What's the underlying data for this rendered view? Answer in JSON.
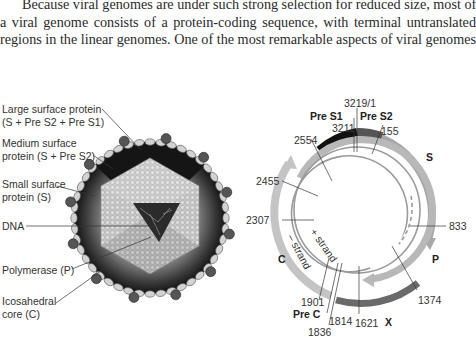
{
  "body_text": {
    "lines": [
      "Because viral genomes are under such strong selection for reduced size, most of",
      "a viral genome consists of a protein-coding sequence, with terminal untranslated",
      "regions in the linear genomes. One of the most remarkable aspects of viral genomes"
    ]
  },
  "virion_figure": {
    "labels": {
      "large_surface_protein": [
        "Large surface protein",
        "(S + Pre S2 + Pre S1)"
      ],
      "medium_surface_protein": [
        "Medium surface",
        "protein (S + Pre S2)"
      ],
      "small_surface_protein": [
        "Small surface",
        "protein (S)"
      ],
      "dna": "DNA",
      "polymerase": "Polymerase (P)",
      "core": [
        "Icosahedral",
        "core (C)"
      ]
    },
    "colors": {
      "envelope_dark": "#1e1e1e",
      "spike": "#555555",
      "lipid_bead": "#d2d2d2",
      "capsid": "#bdbdbd",
      "dna_window": "#2b2b2b"
    }
  },
  "genome_map": {
    "regions": {
      "pre_s1": "Pre S1",
      "pre_s2": "Pre S2",
      "s": "S",
      "p": "P",
      "x": "X",
      "c": "C",
      "pre_c": "Pre C"
    },
    "strands": {
      "plus": "+ strand",
      "minus": "– strand"
    },
    "positions": {
      "p3219": "3219/1",
      "p3211": "3211",
      "p155": "155",
      "p2554": "2554",
      "p2455": "2455",
      "p2307": "2307",
      "p833": "833",
      "p1374": "1374",
      "p1901": "1901",
      "p1814": "1814",
      "p1836": "1836",
      "p1621": "1621"
    },
    "colors": {
      "pre_s1": "#111111",
      "pre_s2": "#555555",
      "s_arc": "#a8a8a8",
      "p_arc": "#b8b8b8",
      "x_arc": "#6a6a6a",
      "c_arc": "#c4c4c4",
      "strand_line": "#9a9a9a"
    }
  }
}
